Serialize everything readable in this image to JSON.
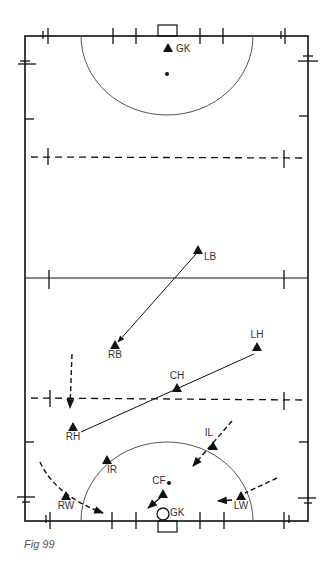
{
  "figure": {
    "caption": "Fig 99",
    "colors": {
      "line": "#111111",
      "arc": "#555555",
      "text": "#333333",
      "caption": "#555555",
      "background": "#ffffff"
    },
    "field": {
      "left": 25,
      "right": 308,
      "top": 36,
      "bottom": 521,
      "halfway_y": 278,
      "dashed_top_y": 157,
      "dashed_bottom_y": 399
    },
    "players": [
      {
        "id": "gk-top",
        "label": "GK",
        "x": 168,
        "y": 48
      },
      {
        "id": "lb",
        "label": "LB",
        "x": 198,
        "y": 250
      },
      {
        "id": "rb",
        "label": "RB",
        "x": 115,
        "y": 345
      },
      {
        "id": "lh",
        "label": "LH",
        "x": 257,
        "y": 347
      },
      {
        "id": "ch",
        "label": "CH",
        "x": 177,
        "y": 388
      },
      {
        "id": "rh",
        "label": "RH",
        "x": 73,
        "y": 427
      },
      {
        "id": "il",
        "label": "IL",
        "x": 213,
        "y": 446
      },
      {
        "id": "ir",
        "label": "IR",
        "x": 107,
        "y": 460
      },
      {
        "id": "cf",
        "label": "CF",
        "x": 163,
        "y": 494
      },
      {
        "id": "rw",
        "label": "RW",
        "x": 66,
        "y": 496
      },
      {
        "id": "lw",
        "label": "LW",
        "x": 241,
        "y": 496
      },
      {
        "id": "gk-bottom",
        "label": "GK",
        "x": 163,
        "y": 514
      }
    ]
  }
}
